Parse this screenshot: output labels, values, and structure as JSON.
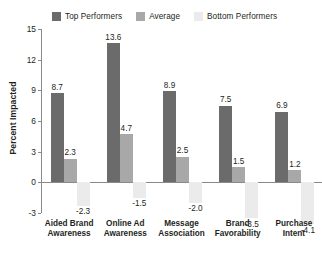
{
  "chart_data": {
    "type": "bar",
    "title": "",
    "subtitle": "",
    "xlabel": "",
    "ylabel": "Percent Impacted",
    "ylim": [
      -3,
      15
    ],
    "yticks": [
      -3,
      0,
      3,
      6,
      9,
      12,
      15
    ],
    "ytick_labels": [
      "-3",
      "0",
      "3",
      "6",
      "9",
      "12",
      "15"
    ],
    "grid": false,
    "legend_position": "top",
    "categories": [
      "Aided Brand Awareness",
      "Online Ad Awareness",
      "Message Association",
      "Brand Favorability",
      "Purchase Intent"
    ],
    "category_lines": [
      [
        "Aided Brand",
        "Awareness"
      ],
      [
        "Online Ad",
        "Awareness"
      ],
      [
        "Message",
        "Association"
      ],
      [
        "Brand",
        "Favorability"
      ],
      [
        "Purchase",
        "Intent"
      ]
    ],
    "series": [
      {
        "name": "Top Performers",
        "color": "#6b6b6b",
        "values": [
          8.7,
          13.6,
          8.9,
          7.5,
          6.9
        ],
        "labels": [
          "8.7",
          "13.6",
          "8.9",
          "7.5",
          "6.9"
        ]
      },
      {
        "name": "Average",
        "color": "#a8a8a8",
        "values": [
          2.3,
          4.7,
          2.5,
          1.5,
          1.2
        ],
        "labels": [
          "2.3",
          "4.7",
          "2.5",
          "1.5",
          "1.2"
        ]
      },
      {
        "name": "Bottom Performers",
        "color": "#ebebeb",
        "values": [
          -2.3,
          -1.5,
          -2.0,
          -3.5,
          -4.1
        ],
        "labels": [
          "-2.3",
          "-1.5",
          "-2.0",
          "-3.5",
          "-4.1"
        ]
      }
    ]
  },
  "legend": {
    "items": [
      {
        "label": "Top Performers",
        "color": "#6b6b6b"
      },
      {
        "label": "Average",
        "color": "#a8a8a8"
      },
      {
        "label": "Bottom Performers",
        "color": "#ebebeb"
      }
    ]
  },
  "axis": {
    "y_title": "Percent Impacted"
  },
  "colors": {
    "top_performers": "#6b6b6b",
    "average": "#a8a8a8",
    "bottom_performers": "#ebebeb",
    "axis": "#8a8a8a",
    "text": "#231f20",
    "background": "#ffffff"
  }
}
